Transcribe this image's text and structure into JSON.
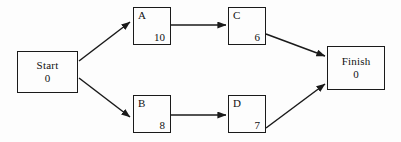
{
  "diagram": {
    "type": "activity-network",
    "background_color": "#fdfdfd",
    "line_color": "#1a1a1a",
    "nodes": [
      {
        "id": "start",
        "label": "Start",
        "value": "0",
        "style": "terminal"
      },
      {
        "id": "a",
        "label": "A",
        "value": "10",
        "style": "activity"
      },
      {
        "id": "b",
        "label": "B",
        "value": "8",
        "style": "activity"
      },
      {
        "id": "c",
        "label": "C",
        "value": "6",
        "style": "activity"
      },
      {
        "id": "d",
        "label": "D",
        "value": "7",
        "style": "activity"
      },
      {
        "id": "finish",
        "label": "Finish",
        "value": "0",
        "style": "terminal"
      }
    ],
    "edges": [
      {
        "from": "start",
        "to": "a"
      },
      {
        "from": "start",
        "to": "b"
      },
      {
        "from": "a",
        "to": "c"
      },
      {
        "from": "b",
        "to": "d"
      },
      {
        "from": "c",
        "to": "finish"
      },
      {
        "from": "d",
        "to": "finish"
      }
    ]
  }
}
